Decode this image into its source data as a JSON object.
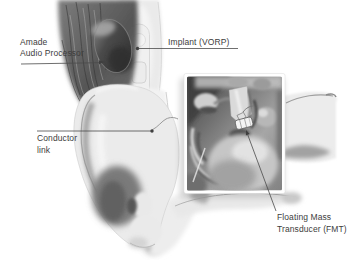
{
  "canvas": {
    "width": 362,
    "height": 260,
    "background": "#ffffff"
  },
  "style": {
    "label_color": "#3d3d3d",
    "leader_line_color": "#4a4a4a"
  },
  "labels": {
    "audio_processor": {
      "line1": "Amade",
      "line2": "Audio Processor"
    },
    "implant": {
      "line1": "Implant (VORP)"
    },
    "conductor_link": {
      "line1": "Conductor",
      "line2": "link"
    },
    "fmt": {
      "line1": "Floating Mass",
      "line2": "Transducer (FMT)"
    }
  }
}
